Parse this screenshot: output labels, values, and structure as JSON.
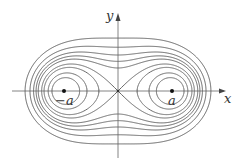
{
  "diagram": {
    "type": "cassini-ovals",
    "origin": {
      "x": 118,
      "y": 91
    },
    "a_px": 54,
    "b_values_px": [
      38,
      44.2,
      50.5,
      54,
      58.7,
      61.6,
      64.9,
      69.5,
      75.6
    ],
    "colors": {
      "curve": "#555555",
      "axis": "#666666",
      "point": "#111111"
    },
    "axes": {
      "x_label": "x",
      "y_label": "y"
    },
    "points": [
      {
        "name": "left-focus",
        "label": "−a"
      },
      {
        "name": "right-focus",
        "label": "a"
      }
    ]
  }
}
